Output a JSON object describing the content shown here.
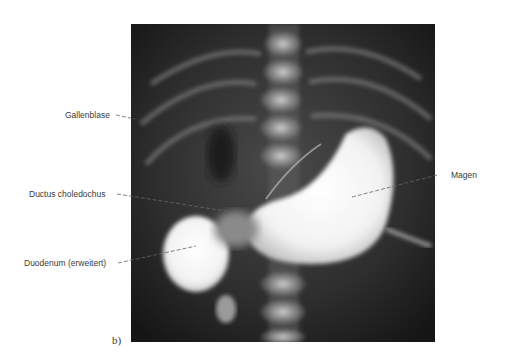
{
  "figure": {
    "panel_label": "b)",
    "labels": [
      {
        "id": "gallenblase",
        "text": "Gallenblase"
      },
      {
        "id": "ductus",
        "text": "Ductus choledochus"
      },
      {
        "id": "duodenum",
        "text": "Duodenum (erweitert)"
      },
      {
        "id": "magen",
        "text": "Magen"
      }
    ]
  }
}
